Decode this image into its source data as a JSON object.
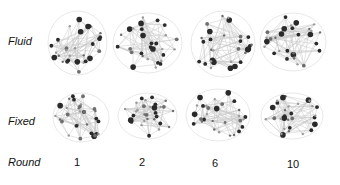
{
  "rows": [
    {
      "label": "Fluid"
    },
    {
      "label": "Fixed"
    },
    {
      "label": "Round"
    }
  ],
  "rounds": [
    "1",
    "2",
    "6",
    "10"
  ],
  "colors": {
    "node_dark": "#2a2a2a",
    "node_mid": "#6e6e6e",
    "node_light": "#9a9a9a",
    "edge": "#c8c8c8",
    "hull": "#e2e2e2"
  }
}
